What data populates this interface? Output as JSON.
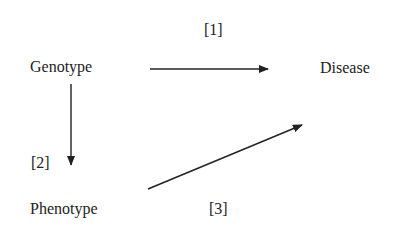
{
  "diagram": {
    "nodes": [
      {
        "id": "genotype",
        "label": "Genotype"
      },
      {
        "id": "disease",
        "label": "Disease"
      },
      {
        "id": "phenotype",
        "label": "Phenotype"
      }
    ],
    "edges": [
      {
        "from": "genotype",
        "to": "disease",
        "label": "[1]"
      },
      {
        "from": "genotype",
        "to": "phenotype",
        "label": "[2]"
      },
      {
        "from": "phenotype",
        "to": "disease",
        "label": "[3]"
      }
    ]
  },
  "colors": {
    "text": "#222222",
    "arrow": "#222222",
    "background": "#ffffff"
  }
}
